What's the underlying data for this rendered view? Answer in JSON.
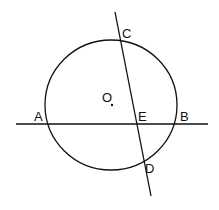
{
  "diagram": {
    "circle": {
      "cx": 111,
      "cy": 105,
      "rx": 66,
      "ry": 65
    },
    "center_label": "O",
    "labels": {
      "A": "A",
      "B": "B",
      "C": "C",
      "D": "D",
      "E": "E",
      "O": "O"
    },
    "lines": [
      {
        "name": "AB",
        "x1": 16,
        "y1": 124,
        "x2": 208,
        "y2": 124
      },
      {
        "name": "CD",
        "x1": 115,
        "y1": 12,
        "x2": 151,
        "y2": 196
      }
    ],
    "stroke_color": "#111111"
  }
}
